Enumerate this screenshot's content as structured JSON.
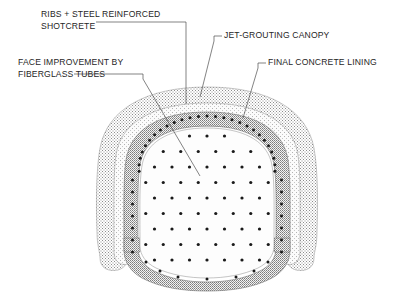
{
  "diagram": {
    "type": "engineering-cross-section",
    "background_color": "#ffffff",
    "labels": [
      {
        "id": "ribs-shotcrete",
        "line1": "RIBS + STEEL REINFORCED",
        "line2": "SHOTCRETE",
        "text_x": 41,
        "text_y": 17,
        "leader": "M 184 26 L 184 22 L 96 22",
        "leader_points": "M 186 27 L 186 104"
      },
      {
        "id": "jet-grouting-canopy",
        "line1": "JET-GROUTING CANOPY",
        "line2": "",
        "text_x": 224,
        "text_y": 38,
        "leader": "M 222 35 L 216 35",
        "leader_points": "M 214 41 L 200 97"
      },
      {
        "id": "face-improvement",
        "line1": "FACE IMPROVEMENT BY",
        "line2": "FIBERGLASS TUBES",
        "text_x": 18,
        "text_y": 65,
        "leader": "M 142 78 L 142 74 L 74 74",
        "leader_points": "M 143 79 L 200 176"
      },
      {
        "id": "final-concrete-lining",
        "line1": "FINAL CONCRETE LINING",
        "line2": "",
        "text_x": 268,
        "text_y": 65,
        "leader": "M 266 62 L 260 62",
        "leader_points": "M 258 68 L 243 118"
      }
    ],
    "layers": [
      {
        "name": "jet-grouting-canopy-ring",
        "description": "outer stippled jet-grouting canopy",
        "fill": "#d7d7d7"
      },
      {
        "name": "final-concrete-lining-ring",
        "description": "light grey final concrete lining band",
        "fill": "#e8e8e8"
      },
      {
        "name": "shotcrete-ring",
        "description": "ribs and steel reinforced shotcrete ring with bolt dots",
        "fill": "#b9b9b9"
      },
      {
        "name": "tunnel-core",
        "description": "excavation face with fiberglass tube dots",
        "fill": "#fdfdfd"
      }
    ],
    "dot_color": "#1a1a1a",
    "outline_color": "#4a4a4a",
    "face_dot_count": 88,
    "ring_dot_count": 46
  }
}
